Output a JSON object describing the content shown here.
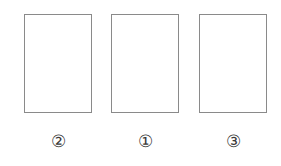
{
  "figure": {
    "background_color": "#ffffff",
    "stroke_color": "#8a8a8a",
    "label_color": "#3a3a3a",
    "panels": [
      {
        "position": "left",
        "label": "②",
        "label_number": "2",
        "fill": "empty"
      },
      {
        "position": "center",
        "label": "①",
        "label_number": "1",
        "fill": "empty"
      },
      {
        "position": "right",
        "label": "③",
        "label_number": "3",
        "fill": "empty"
      }
    ]
  }
}
